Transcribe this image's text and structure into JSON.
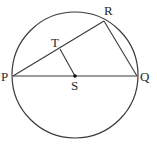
{
  "diagram": {
    "type": "geometry",
    "stroke_color": "#3a3a3a",
    "circle": {
      "center": "S",
      "cx": 75,
      "cy": 75,
      "r": 63
    },
    "points": [
      {
        "id": "P",
        "label": "P",
        "x": 13,
        "y": 76,
        "label_x": 1,
        "label_y": 81
      },
      {
        "id": "Q",
        "label": "Q",
        "x": 137,
        "y": 76,
        "label_x": 140,
        "label_y": 81
      },
      {
        "id": "R",
        "label": "R",
        "x": 104,
        "y": 21,
        "label_x": 104,
        "label_y": 15
      },
      {
        "id": "T",
        "label": "T",
        "x": 60,
        "y": 49,
        "label_x": 51,
        "label_y": 47
      },
      {
        "id": "S",
        "label": "S",
        "x": 75,
        "y": 76,
        "label_x": 71,
        "label_y": 90
      }
    ],
    "segments": [
      {
        "from": "P",
        "to": "Q"
      },
      {
        "from": "P",
        "to": "R"
      },
      {
        "from": "R",
        "to": "Q"
      },
      {
        "from": "T",
        "to": "S"
      }
    ]
  }
}
